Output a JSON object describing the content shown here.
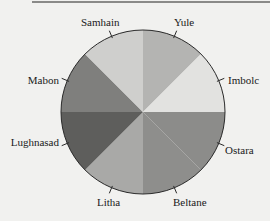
{
  "chart_data": {
    "type": "pie",
    "title": "",
    "categories": [
      "Yule",
      "Imbolc",
      "Ostara",
      "Beltane",
      "Litha",
      "Lughnasad",
      "Mabon",
      "Samhain"
    ],
    "values": [
      12.5,
      12.5,
      12.5,
      12.5,
      12.5,
      12.5,
      12.5,
      12.5
    ],
    "colors": [
      "#b4b4b2",
      "#e2e2e0",
      "#8c8c8a",
      "#8e8e8c",
      "#a9a9a7",
      "#5e5e5c",
      "#7f7f7d",
      "#cfcfcd"
    ],
    "start_angle_deg": 90,
    "direction": "clockwise",
    "legend": "none",
    "labels_outside": true
  },
  "labels": {
    "yule": "Yule",
    "imbolc": "Imbolc",
    "ostara": "Ostara",
    "beltane": "Beltane",
    "litha": "Litha",
    "lughnasad": "Lughnasad",
    "mabon": "Mabon",
    "samhain": "Samhain"
  }
}
